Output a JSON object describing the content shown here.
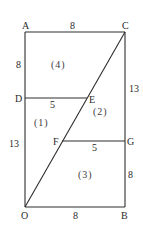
{
  "diagram": {
    "points": {
      "A": {
        "label": "A",
        "x": 25,
        "y": 32
      },
      "C": {
        "label": "C",
        "x": 125,
        "y": 32
      },
      "D": {
        "label": "D",
        "x": 25,
        "y": 98
      },
      "E": {
        "label": "E",
        "x": 87,
        "y": 98
      },
      "F": {
        "label": "F",
        "x": 62,
        "y": 141
      },
      "G": {
        "label": "G",
        "x": 125,
        "y": 141
      },
      "O": {
        "label": "O",
        "x": 25,
        "y": 207
      },
      "B": {
        "label": "B",
        "x": 125,
        "y": 207
      }
    },
    "lengths": {
      "AC": "8",
      "AD": "8",
      "DO": "13",
      "CG": "13",
      "GB": "8",
      "OB": "8",
      "DE": "5",
      "FG": "5"
    },
    "regions": {
      "r1": "(1)",
      "r2": "(2)",
      "r3": "(3)",
      "r4": "(4)"
    },
    "stroke_color": "#2e2e2e"
  }
}
